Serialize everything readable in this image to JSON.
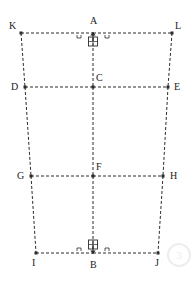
{
  "diagram": {
    "type": "engineering-frame-schematic",
    "canvas": {
      "width": 195,
      "height": 283
    },
    "style": {
      "line_color": "#2b2b2b",
      "line_style": "dashed",
      "line_width": 1,
      "dash_pattern": "3 2",
      "node_marker": "filled-square",
      "node_marker_size": 3,
      "background": "#ffffff"
    },
    "nodes": [
      {
        "id": "K",
        "label": "K",
        "x": 21,
        "y": 33,
        "label_dx": -12,
        "label_dy": -12,
        "marker": true
      },
      {
        "id": "A",
        "label": "A",
        "x": 93,
        "y": 33,
        "label_dx": -3,
        "label_dy": -17,
        "marker": false
      },
      {
        "id": "L",
        "label": "L",
        "x": 172,
        "y": 33,
        "label_dx": 3,
        "label_dy": -12,
        "marker": true
      },
      {
        "id": "D",
        "label": "D",
        "x": 25,
        "y": 87,
        "label_dx": -14,
        "label_dy": -5,
        "marker": true
      },
      {
        "id": "C",
        "label": "C",
        "x": 93,
        "y": 87,
        "label_dx": 3,
        "label_dy": -14,
        "marker": true
      },
      {
        "id": "E",
        "label": "E",
        "x": 168,
        "y": 87,
        "label_dx": 6,
        "label_dy": -5,
        "marker": true
      },
      {
        "id": "G",
        "label": "G",
        "x": 31,
        "y": 176,
        "label_dx": -14,
        "label_dy": -5,
        "marker": true
      },
      {
        "id": "F",
        "label": "F",
        "x": 93,
        "y": 176,
        "label_dx": 3,
        "label_dy": -14,
        "marker": true
      },
      {
        "id": "H",
        "label": "H",
        "x": 163,
        "y": 176,
        "label_dx": 7,
        "label_dy": -5,
        "marker": true
      },
      {
        "id": "I",
        "label": "I",
        "x": 36,
        "y": 253,
        "label_dx": -4,
        "label_dy": 5,
        "marker": true
      },
      {
        "id": "B",
        "label": "B",
        "x": 93,
        "y": 253,
        "label_dx": -3,
        "label_dy": 7,
        "marker": false
      },
      {
        "id": "J",
        "label": "J",
        "x": 158,
        "y": 253,
        "label_dx": -3,
        "label_dy": 5,
        "marker": true
      }
    ],
    "members": [
      {
        "name": "top-chord-left",
        "from": "K",
        "to": "A"
      },
      {
        "name": "top-chord-right",
        "from": "A",
        "to": "L"
      },
      {
        "name": "row2-left",
        "from": "D",
        "to": "C"
      },
      {
        "name": "row2-right",
        "from": "C",
        "to": "E"
      },
      {
        "name": "row3-left",
        "from": "G",
        "to": "F"
      },
      {
        "name": "row3-right",
        "from": "F",
        "to": "H"
      },
      {
        "name": "bottom-chord-left",
        "from": "I",
        "to": "B"
      },
      {
        "name": "bottom-chord-right",
        "from": "B",
        "to": "J"
      },
      {
        "name": "left-post-upper",
        "from": "K",
        "to": "D"
      },
      {
        "name": "left-post-middle",
        "from": "D",
        "to": "G"
      },
      {
        "name": "left-post-lower",
        "from": "G",
        "to": "I"
      },
      {
        "name": "right-post-upper",
        "from": "L",
        "to": "E"
      },
      {
        "name": "right-post-middle",
        "from": "E",
        "to": "H"
      },
      {
        "name": "right-post-lower",
        "from": "H",
        "to": "J"
      },
      {
        "name": "center-post-1",
        "from": "A",
        "to": "C"
      },
      {
        "name": "center-post-2",
        "from": "C",
        "to": "F"
      },
      {
        "name": "center-post-3",
        "from": "F",
        "to": "B"
      }
    ],
    "supports": [
      {
        "name": "support-top",
        "at_node": "A",
        "x": 93,
        "y": 37,
        "arrow_direction": "up",
        "shape": "square-with-arrow",
        "hatched": true
      },
      {
        "name": "support-bottom",
        "at_node": "B",
        "x": 93,
        "y": 249,
        "arrow_direction": "down",
        "shape": "square-with-arrow",
        "hatched": true
      }
    ],
    "watermark": {
      "text": "3",
      "color": "#ededed"
    }
  }
}
